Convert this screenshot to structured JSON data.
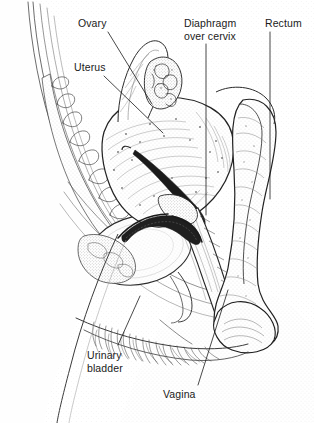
{
  "figure": {
    "width": 314,
    "height": 423,
    "background_color": "#fefefe",
    "ink_color": "#1a1a1a",
    "style": "pen-and-ink stipple medical illustration, monochrome line art"
  },
  "labels": {
    "ovary": "Ovary",
    "uterus": "Uterus",
    "diaphragm_line1": "Diaphragm",
    "diaphragm_line2": "over cervix",
    "rectum": "Rectum",
    "urinary_line1": "Urinary",
    "urinary_line2": "bladder",
    "vagina": "Vagina"
  },
  "leader_lines": [
    {
      "name": "ovary-leader",
      "from": [
        108,
        32
      ],
      "to": [
        152,
        104
      ]
    },
    {
      "name": "uterus-leader",
      "from": [
        104,
        76
      ],
      "to": [
        163,
        133
      ]
    },
    {
      "name": "diaphragm-leader",
      "from": [
        206,
        44
      ],
      "to": [
        206,
        215
      ]
    },
    {
      "name": "rectum-leader",
      "from": [
        270,
        32
      ],
      "to": [
        270,
        199
      ]
    },
    {
      "name": "urinary-bladder-leader",
      "from": [
        118,
        345
      ],
      "to": [
        140,
        296
      ]
    },
    {
      "name": "vagina-leader",
      "from": [
        198,
        385
      ],
      "to": [
        228,
        290
      ]
    }
  ],
  "anatomy": [
    {
      "name": "sacrum-vertebrae",
      "note": "segmented bony column, upper left, curving down-right"
    },
    {
      "name": "pubic-symphysis",
      "note": "small bone block, lower left of bladder"
    },
    {
      "name": "uterus-body",
      "note": "large anteverted ovoid, centre, stippled myometrium"
    },
    {
      "name": "endometrial-cavity",
      "note": "dark slit line within uterus"
    },
    {
      "name": "ovary",
      "note": "small ovoid with fimbriae, upper centre"
    },
    {
      "name": "fallopian-tube",
      "note": "tapering tube from uterine fundus to ovary"
    },
    {
      "name": "urinary-bladder",
      "note": "large oval, stippled, left of vagina"
    },
    {
      "name": "urethra",
      "note": "short channel from bladder neck to perineum"
    },
    {
      "name": "vagina",
      "note": "narrow canal running down-right from cervix"
    },
    {
      "name": "cervix",
      "note": "junction of uterus and vagina"
    },
    {
      "name": "contraceptive-diaphragm",
      "note": "dark rim arc seated over cervix in vaginal fornix"
    },
    {
      "name": "rectum",
      "note": "broad tube, right side, descending to anal canal"
    },
    {
      "name": "anal-canal",
      "note": "bulbous terminal, lower right"
    },
    {
      "name": "pubic-hair",
      "note": "fine hatched strokes along mons pubis, lower centre-left"
    },
    {
      "name": "abdominal-wall",
      "note": "outer body contour, far left"
    },
    {
      "name": "thigh-contour",
      "note": "sweeping line lower left"
    }
  ]
}
